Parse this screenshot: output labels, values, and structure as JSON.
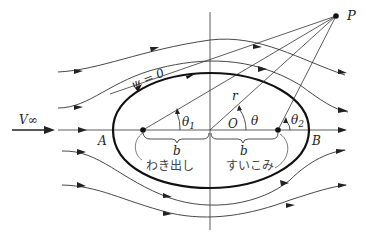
{
  "diagram": {
    "type": "Rankine oval flow (source-sink in uniform stream)",
    "labels": {
      "point_p": "P",
      "stream_fn": "ψ = 0",
      "free_stream": "V∞",
      "point_a": "A",
      "point_b": "B",
      "origin": "O",
      "radius": "r",
      "theta": "θ",
      "theta1": "θ",
      "theta1_sub": "1",
      "theta2": "θ",
      "theta2_sub": "2",
      "b_left": "b",
      "b_right": "b",
      "source_label": "わき出し",
      "sink_label": "すいこみ"
    },
    "colors": {
      "line": "#222222",
      "text": "#222222",
      "background": "#ffffff"
    }
  }
}
